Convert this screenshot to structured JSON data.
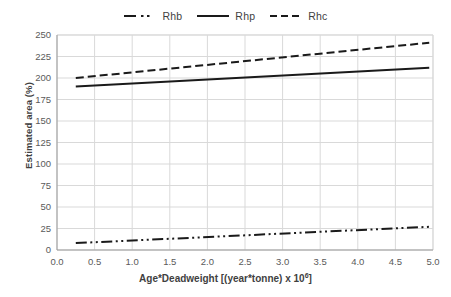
{
  "chart_data": {
    "type": "line",
    "title": "",
    "xlabel": "Age*Deadweight [(year*tonne) x 10⁶]",
    "xlabel_base": "Age*Deadweight [(year*tonne) x 10",
    "xlabel_exp": "6",
    "xlabel_tail": "]",
    "ylabel": "Estimated area (%)",
    "xlim": [
      0.0,
      5.0
    ],
    "ylim": [
      0,
      250
    ],
    "xticks": [
      "0.0",
      "0.5",
      "1.0",
      "1.5",
      "2.0",
      "2.5",
      "3.0",
      "3.5",
      "4.0",
      "4.5",
      "5.0"
    ],
    "xtick_values": [
      0.0,
      0.5,
      1.0,
      1.5,
      2.0,
      2.5,
      3.0,
      3.5,
      4.0,
      4.5,
      5.0
    ],
    "yticks": [
      "0",
      "25",
      "50",
      "75",
      "100",
      "125",
      "150",
      "175",
      "200",
      "225",
      "250"
    ],
    "ytick_values": [
      0,
      25,
      50,
      75,
      100,
      125,
      150,
      175,
      200,
      225,
      250
    ],
    "grid": true,
    "grid_color": "#d9d9d9",
    "legend_position": "top-center",
    "x": [
      0.25,
      4.95
    ],
    "series": [
      {
        "name": "Rhb",
        "style": "dash-dot-dot",
        "color": "#1a1a1a",
        "values": [
          8,
          27
        ]
      },
      {
        "name": "Rhp",
        "style": "solid",
        "color": "#1a1a1a",
        "values": [
          190,
          212
        ]
      },
      {
        "name": "Rhc",
        "style": "dashed",
        "color": "#1a1a1a",
        "values": [
          200,
          241
        ]
      }
    ]
  },
  "legend": {
    "items": [
      {
        "label": "Rhb",
        "style": "dash-dot-dot"
      },
      {
        "label": "Rhp",
        "style": "solid"
      },
      {
        "label": "Rhc",
        "style": "dashed"
      }
    ]
  }
}
